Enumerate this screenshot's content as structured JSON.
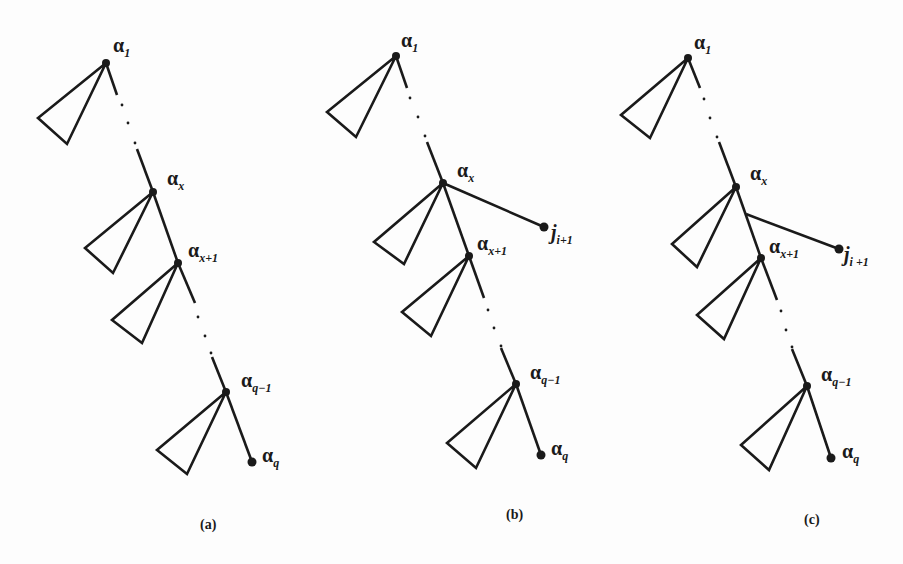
{
  "figure": {
    "panels": [
      {
        "id": "a",
        "caption": "(a)",
        "labels": {
          "alpha_1": {
            "base": "α",
            "sub": "1"
          },
          "alpha_x": {
            "base": "α",
            "sub": "x"
          },
          "alpha_x1": {
            "base": "α",
            "sub": "x+1"
          },
          "alpha_q1": {
            "base": "α",
            "sub": "q−1"
          },
          "alpha_q": {
            "base": "α",
            "sub": "q"
          }
        }
      },
      {
        "id": "b",
        "caption": "(b)",
        "labels": {
          "alpha_1": {
            "base": "α",
            "sub": "1"
          },
          "alpha_x": {
            "base": "α",
            "sub": "x"
          },
          "alpha_x1": {
            "base": "α",
            "sub": "x+1"
          },
          "alpha_q1": {
            "base": "α",
            "sub": "q−1"
          },
          "alpha_q": {
            "base": "α",
            "sub": "q"
          },
          "j_i1": {
            "base": "j",
            "sub": "i+1"
          }
        }
      },
      {
        "id": "c",
        "caption": "(c)",
        "labels": {
          "alpha_1": {
            "base": "α",
            "sub": "1"
          },
          "alpha_x": {
            "base": "α",
            "sub": "x"
          },
          "alpha_x1": {
            "base": "α",
            "sub": "x+1"
          },
          "alpha_q1": {
            "base": "α",
            "sub": "q−1"
          },
          "alpha_q": {
            "base": "α",
            "sub": "q"
          },
          "j_i1": {
            "base": "j",
            "sub": "i +1"
          }
        }
      }
    ],
    "colors": {
      "ink": "#1a1a1a",
      "background": "#fdfdfd"
    }
  }
}
